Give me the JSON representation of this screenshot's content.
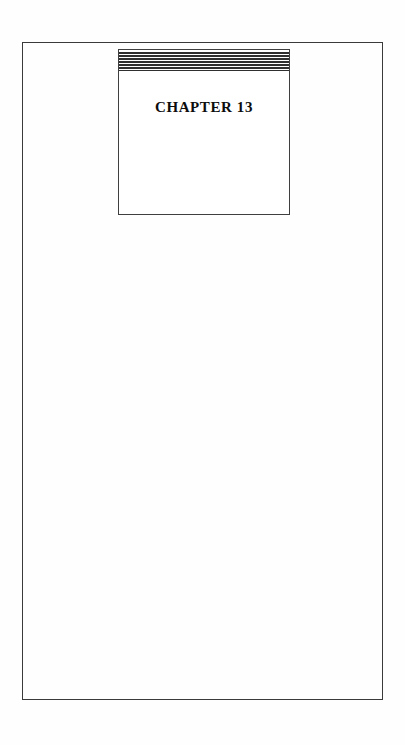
{
  "document": {
    "kind": "scanned-book-page",
    "page_background_color": "#fefefe",
    "ink_color": "#2f2f2f",
    "title_color": "#0d0d0d"
  },
  "page_frame": {
    "border_color": "#3a3a3a"
  },
  "chapter_box": {
    "border_color": "#3f3f3f",
    "title": "CHAPTER 13",
    "rule_band": {
      "count": 7,
      "rules": [
        {
          "weight": "thick"
        },
        {
          "weight": "thick"
        },
        {
          "weight": "thick"
        },
        {
          "weight": "thick"
        },
        {
          "weight": "thick"
        },
        {
          "weight": "thick"
        },
        {
          "weight": "thin"
        }
      ]
    }
  },
  "page_body": {
    "content": ""
  }
}
